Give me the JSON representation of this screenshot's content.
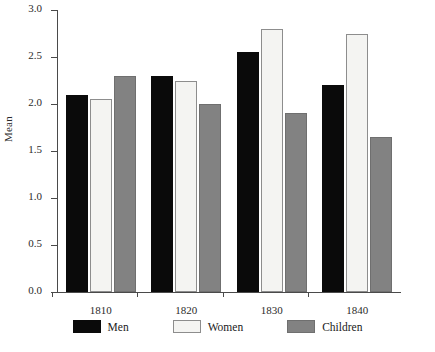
{
  "chart_data": {
    "type": "bar",
    "title": "",
    "xlabel": "",
    "ylabel": "Mean",
    "categories": [
      "1810",
      "1820",
      "1830",
      "1840"
    ],
    "series": [
      {
        "name": "Men",
        "color": "#0a0a0a",
        "values": [
          2.1,
          2.3,
          2.55,
          2.2
        ]
      },
      {
        "name": "Women",
        "color": "#f4f4f2",
        "values": [
          2.05,
          2.25,
          2.8,
          2.75
        ]
      },
      {
        "name": "Children",
        "color": "#828282",
        "values": [
          2.3,
          2.0,
          1.9,
          1.65
        ]
      }
    ],
    "ylim": [
      0.0,
      3.0
    ],
    "ytick_labels": [
      "0.0",
      "0.5",
      "1.0",
      "1.5",
      "2.0",
      "2.5",
      "3.0"
    ],
    "ytick_values": [
      0.0,
      0.5,
      1.0,
      1.5,
      2.0,
      2.5,
      3.0
    ],
    "grid": false,
    "legend_position": "bottom"
  }
}
